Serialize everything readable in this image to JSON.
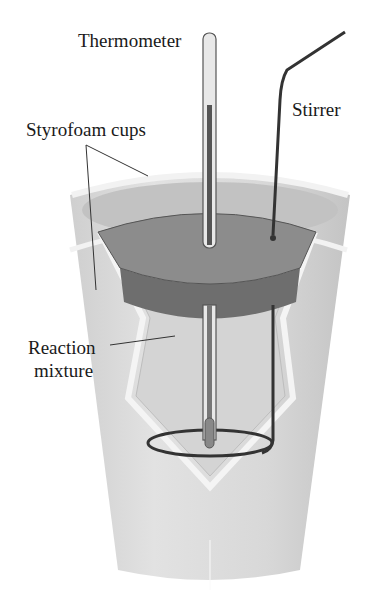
{
  "diagram": {
    "type": "coffee-cup calorimeter",
    "labels": {
      "thermometer": "Thermometer",
      "stirrer": "Stirrer",
      "cups": "Styrofoam cups",
      "mixture_line1": "Reaction",
      "mixture_line2": "mixture"
    },
    "colors": {
      "cup": "#d9d9d9",
      "cup_rim": "#eeeeee",
      "lid_top": "#8c8c8c",
      "lid_side": "#6e6e6e",
      "stirrer": "#333333",
      "background": "#ffffff"
    }
  }
}
